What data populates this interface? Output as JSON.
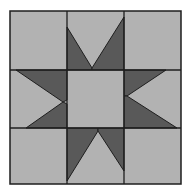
{
  "colors": {
    "background": "#ffffff",
    "light": "#b2b2b2",
    "dark": "#595959",
    "line": "#1e1e1e"
  },
  "block": {
    "x": 10,
    "y": 11,
    "width": 171,
    "height": 173
  },
  "grid": {
    "verticals": [
      67,
      124
    ],
    "horizontals": [
      70,
      128
    ]
  },
  "center_square": {
    "x": 67,
    "y": 70,
    "width": 57,
    "height": 58
  },
  "dark_pieces": [
    {
      "name": "top-left-star-point",
      "points": "67,27 92,68 92,70 67,70"
    },
    {
      "name": "top-right-star-point",
      "points": "124,17 124,70 92,70 92,68"
    },
    {
      "name": "left-top-star-point",
      "points": "16,70 67,70 67,100 63,102"
    },
    {
      "name": "left-bottom-star-point",
      "points": "63,102 67,104 67,128 26,128"
    },
    {
      "name": "right-top-star-point",
      "points": "124,70 166,70 127,96 124,96"
    },
    {
      "name": "right-bottom-star-point",
      "points": "124,96 127,96 177,128 124,128"
    },
    {
      "name": "bottom-left-star-point",
      "points": "67,128 98,128 98,131 67,181"
    },
    {
      "name": "bottom-right-star-point",
      "points": "98,128 124,128 124,171 98,131"
    }
  ]
}
